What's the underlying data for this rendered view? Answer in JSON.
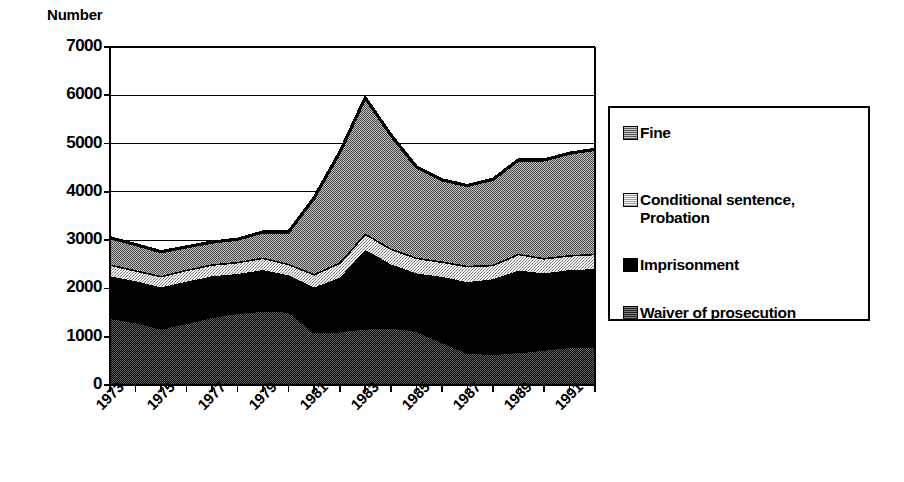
{
  "axis": {
    "y_title": "Number",
    "y_ticks": [
      "7000",
      "6000",
      "5000",
      "4000",
      "3000",
      "2000",
      "1000",
      "0"
    ],
    "x_ticks": [
      "1973",
      "1975",
      "1977",
      "1979",
      "1981",
      "1983",
      "1985",
      "1987",
      "1989",
      "1991"
    ]
  },
  "legend": {
    "items": [
      {
        "label": "Fine",
        "swatch": "fine-swatch-icon",
        "color": "#9a9a9a"
      },
      {
        "label": "Conditional sentence,\nProbation",
        "swatch": "conditional-swatch-icon",
        "color": "#e2e2e2"
      },
      {
        "label": "Imprisonment",
        "swatch": "imprisonment-swatch-icon",
        "color": "#000000"
      },
      {
        "label": "Waiver of prosecution",
        "swatch": "waiver-swatch-icon",
        "color": "#4a4a4a"
      }
    ]
  },
  "chart_data": {
    "type": "area",
    "stacked": true,
    "title": "",
    "xlabel": "",
    "ylabel": "Number",
    "ylim": [
      0,
      7000
    ],
    "ytick_step": 1000,
    "grid": true,
    "legend_position": "right",
    "x": [
      1973,
      1974,
      1975,
      1976,
      1977,
      1978,
      1979,
      1980,
      1981,
      1982,
      1983,
      1984,
      1985,
      1986,
      1987,
      1988,
      1989,
      1990,
      1991,
      1992
    ],
    "categories": [
      "1973",
      "1974",
      "1975",
      "1976",
      "1977",
      "1978",
      "1979",
      "1980",
      "1981",
      "1982",
      "1983",
      "1984",
      "1985",
      "1986",
      "1987",
      "1988",
      "1989",
      "1990",
      "1991",
      "1992"
    ],
    "stack_order_bottom_to_top": [
      "Waiver of prosecution",
      "Imprisonment",
      "Conditional sentence, Probation",
      "Fine"
    ],
    "series": [
      {
        "name": "Waiver of prosecution",
        "color": "#4a4a4a",
        "values": [
          1400,
          1310,
          1180,
          1290,
          1420,
          1500,
          1550,
          1530,
          1100,
          1120,
          1180,
          1200,
          1130,
          900,
          680,
          650,
          690,
          740,
          800,
          800
        ]
      },
      {
        "name": "Imprisonment",
        "color": "#000000",
        "values": [
          850,
          840,
          840,
          850,
          830,
          800,
          830,
          740,
          920,
          1100,
          1620,
          1300,
          1180,
          1340,
          1450,
          1540,
          1680,
          1570,
          1580,
          1600
        ]
      },
      {
        "name": "Conditional sentence, Probation",
        "color": "#e2e2e2",
        "values": [
          250,
          230,
          240,
          250,
          250,
          250,
          260,
          240,
          280,
          320,
          340,
          330,
          330,
          320,
          340,
          300,
          350,
          320,
          310,
          320
        ]
      },
      {
        "name": "Fine",
        "color": "#9a9a9a",
        "values": [
          550,
          530,
          500,
          470,
          460,
          470,
          530,
          660,
          1580,
          2280,
          2810,
          2350,
          1880,
          1690,
          1660,
          1770,
          1940,
          2030,
          2110,
          2160
        ]
      }
    ],
    "totals": [
      3050,
      2910,
      2760,
      2860,
      2960,
      3020,
      3170,
      3170,
      3880,
      4820,
      5950,
      5180,
      4520,
      4250,
      4130,
      4260,
      4660,
      4660,
      4800,
      4880
    ],
    "peak": {
      "year": 1983,
      "value": 5950
    }
  }
}
